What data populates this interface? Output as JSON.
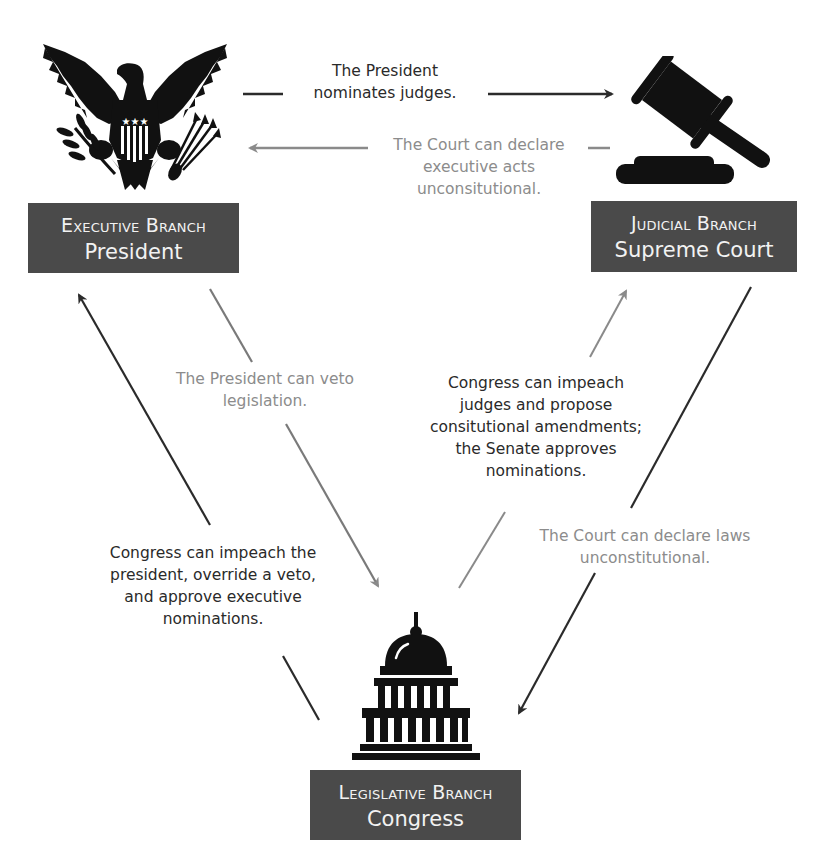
{
  "colors": {
    "box_background": "#4a4a4a",
    "box_text": "#f2f2f2",
    "dark_text": "#2a2a2a",
    "light_text": "#8c8c8c",
    "dark_arrow": "#2b2b2b",
    "light_arrow": "#8a8a8a"
  },
  "branches": {
    "executive": {
      "title": "Executive Branch",
      "subtitle": "President",
      "icon": "eagle-seal-icon"
    },
    "judicial": {
      "title": "Judicial Branch",
      "subtitle": "Supreme Court",
      "icon": "gavel-icon"
    },
    "legislative": {
      "title": "Legislative Branch",
      "subtitle": "Congress",
      "icon": "capitol-building-icon"
    }
  },
  "relations": {
    "president_nominates": "The President nominates judges.",
    "court_declares_exec": "The Court can declare executive acts unconsitutional.",
    "president_veto": "The President can veto legislation.",
    "congress_checks_court": "Congress can impeach judges and propose consitutional amendments; the Senate approves nominations.",
    "court_declares_laws": "The Court can declare laws unconstitutional.",
    "congress_checks_president": "Congress can impeach the president, override a veto, and approve executive nominations."
  },
  "relation_lines": {
    "president_nominates": [
      "The President",
      "nominates judges."
    ],
    "court_declares_exec": [
      "The Court can declare",
      "executive acts",
      "unconsitutional."
    ],
    "president_veto": [
      "The President can veto",
      "legislation."
    ],
    "congress_checks_court": [
      "Congress can impeach",
      "judges and propose",
      "consitutional amendments;",
      "the Senate approves",
      "nominations."
    ],
    "court_declares_laws": [
      "The Court can declare laws",
      "unconstitutional."
    ],
    "congress_checks_president": [
      "Congress can impeach the",
      "president, override a veto,",
      "and approve executive",
      "nominations."
    ]
  }
}
